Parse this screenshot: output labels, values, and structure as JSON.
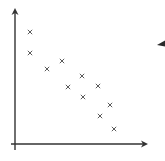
{
  "chart_data": {
    "type": "scatter",
    "title": "",
    "xlabel": "",
    "ylabel": "",
    "grid": false,
    "legend": null,
    "marker": "x",
    "axes": {
      "style": "arrows",
      "ticks": false,
      "xlim": [
        0,
        132
      ],
      "ylim": [
        0,
        135
      ]
    },
    "points": [
      {
        "x": 15,
        "y": 112
      },
      {
        "x": 15,
        "y": 91
      },
      {
        "x": 32,
        "y": 75
      },
      {
        "x": 47,
        "y": 83
      },
      {
        "x": 53,
        "y": 57
      },
      {
        "x": 67,
        "y": 68
      },
      {
        "x": 68,
        "y": 47
      },
      {
        "x": 83,
        "y": 58
      },
      {
        "x": 95,
        "y": 39
      },
      {
        "x": 85,
        "y": 28
      },
      {
        "x": 99,
        "y": 15
      }
    ],
    "trend": "negative correlation"
  },
  "colors": {
    "axis": "#333333",
    "marker": "#5a5a5a",
    "background": "#ffffff"
  },
  "icons": {
    "pointer": "left-pointing-triangle"
  }
}
